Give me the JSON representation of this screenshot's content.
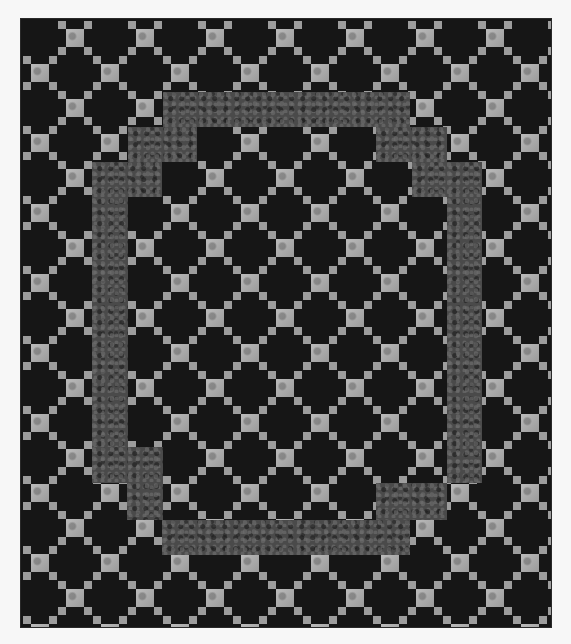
{
  "image": {
    "subject": "Irish chain style quilt with stepped textured border frame",
    "caption": "Black quilt with light gray nine-patch lattice and a stepped mottled gray inner frame"
  },
  "quilt": {
    "left": 21,
    "top": 19,
    "width": 530,
    "height": 608,
    "colors": {
      "background": "#161616",
      "light_square": "#a9a9a9",
      "small_square": "#9d9d9d",
      "frame": "#4a4a4a",
      "page": "#f7f7f7"
    },
    "lattice": {
      "origin_x": 19,
      "origin_y": 19,
      "pitch": 35,
      "cols": 16,
      "rows": 18,
      "large_size": 18,
      "small_size": 8,
      "small_offset": 13
    },
    "frame_rects": [
      {
        "x": 142,
        "y": 73,
        "w": 247,
        "h": 35
      },
      {
        "x": 107,
        "y": 108,
        "w": 69,
        "h": 35
      },
      {
        "x": 355,
        "y": 108,
        "w": 71,
        "h": 35
      },
      {
        "x": 71,
        "y": 143,
        "w": 36,
        "h": 286
      },
      {
        "x": 71,
        "y": 143,
        "w": 70,
        "h": 35
      },
      {
        "x": 391,
        "y": 143,
        "w": 70,
        "h": 35
      },
      {
        "x": 426,
        "y": 143,
        "w": 35,
        "h": 321
      },
      {
        "x": 106,
        "y": 428,
        "w": 36,
        "h": 73
      },
      {
        "x": 71,
        "y": 428,
        "w": 36,
        "h": 36
      },
      {
        "x": 391,
        "y": 464,
        "w": 35,
        "h": 37
      },
      {
        "x": 355,
        "y": 464,
        "w": 71,
        "h": 37
      },
      {
        "x": 141,
        "y": 501,
        "w": 248,
        "h": 35
      }
    ]
  }
}
